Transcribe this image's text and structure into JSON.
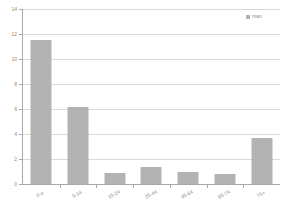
{
  "chart_data": {
    "type": "bar",
    "title": "",
    "subtitle": "",
    "xlabel": "",
    "ylabel": "",
    "categories": [
      "0-4",
      "5-14",
      "15-24",
      "25-44",
      "45-64",
      "65-74",
      "75+"
    ],
    "values": [
      11.5,
      6.2,
      0.9,
      1.4,
      0.95,
      0.8,
      3.7
    ],
    "series": [
      {
        "name": "man",
        "values": [
          11.5,
          6.2,
          0.9,
          1.4,
          0.95,
          0.8,
          3.7
        ],
        "color": "#b3b3b3"
      }
    ],
    "ylim": [
      0,
      14
    ],
    "yticks": [
      0,
      2,
      4,
      6,
      8,
      10,
      12,
      14
    ],
    "ytick_labels": [
      "0",
      "2",
      "4",
      "6",
      "8",
      "10",
      "12",
      "14"
    ],
    "grid": true,
    "grid_axis": "y",
    "legend": {
      "position": "top-right",
      "entries": [
        "man"
      ]
    },
    "colors": {
      "bar": "#b3b3b3",
      "gridline": "#d9d9d9",
      "axis": "#a8a8a8",
      "text": "#8a8a8a",
      "background": "#ffffff"
    }
  }
}
